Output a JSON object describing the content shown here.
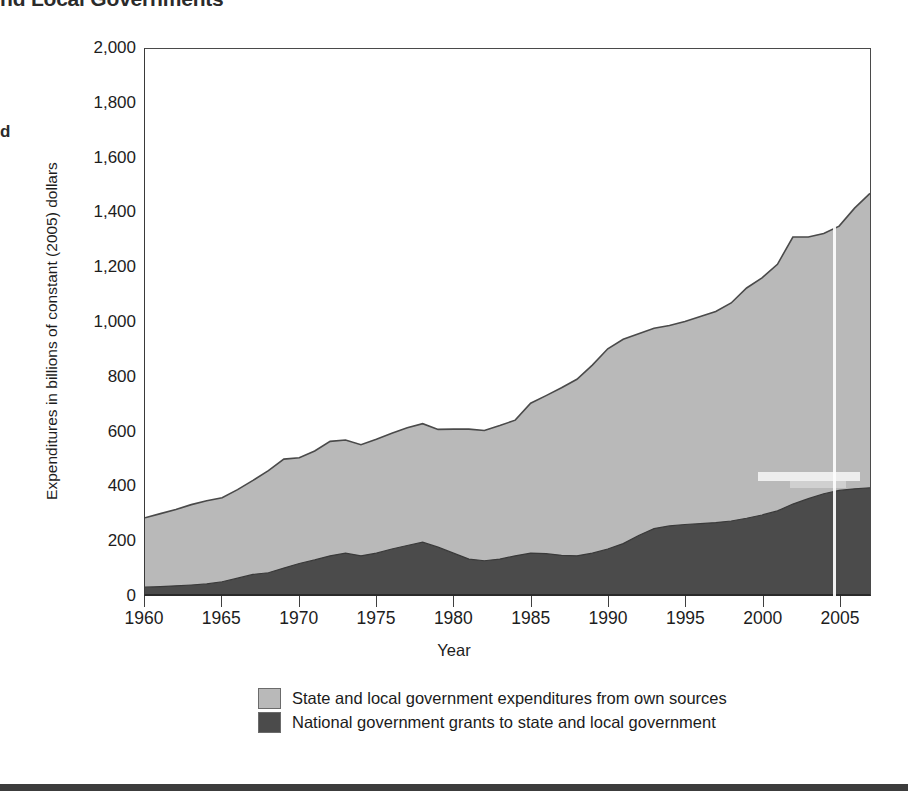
{
  "figure": {
    "title_partial": "nd Local Governments",
    "margin_stub": "d",
    "xaxis_title": "Year",
    "yaxis_title": "Expenditures in billions of constant (2005) dollars"
  },
  "legend": {
    "items": [
      {
        "label": "State and local government expenditures from own sources",
        "color": "#b9b9b9"
      },
      {
        "label": "National government grants to state and local government",
        "color": "#4b4b4b"
      }
    ]
  },
  "axes": {
    "y_ticks": [
      "0",
      "200",
      "400",
      "600",
      "800",
      "1,000",
      "1,200",
      "1,400",
      "1,600",
      "1,800",
      "2,000"
    ],
    "x_ticks": [
      "1960",
      "1965",
      "1970",
      "1975",
      "1980",
      "1985",
      "1990",
      "1995",
      "2000",
      "2005"
    ]
  },
  "colors": {
    "own_sources": "#b9b9b9",
    "grants": "#4b4b4b",
    "outline": "#4a4a4a",
    "axis": "#3a3a3a",
    "bottom_rule": "#3c3c3c"
  },
  "chart_data": {
    "type": "area",
    "stacked": true,
    "title": "nd Local Governments",
    "xlabel": "Year",
    "ylabel": "Expenditures in billions of constant (2005) dollars",
    "xlim": [
      1960,
      2007
    ],
    "ylim": [
      0,
      2000
    ],
    "grid": false,
    "legend_position": "bottom-center",
    "x": [
      1960,
      1961,
      1962,
      1963,
      1964,
      1965,
      1966,
      1967,
      1968,
      1969,
      1970,
      1971,
      1972,
      1973,
      1974,
      1975,
      1976,
      1977,
      1978,
      1979,
      1980,
      1981,
      1982,
      1983,
      1984,
      1985,
      1986,
      1987,
      1988,
      1989,
      1990,
      1991,
      1992,
      1993,
      1994,
      1995,
      1996,
      1997,
      1998,
      1999,
      2000,
      2001,
      2002,
      2003,
      2004,
      2005,
      2006,
      2007
    ],
    "series": [
      {
        "name": "National government grants to state and local government",
        "values": [
          25,
          27,
          30,
          33,
          37,
          45,
          58,
          72,
          78,
          95,
          112,
          125,
          140,
          150,
          140,
          150,
          165,
          178,
          190,
          172,
          150,
          128,
          122,
          128,
          140,
          150,
          148,
          142,
          140,
          150,
          165,
          185,
          215,
          240,
          250,
          255,
          258,
          262,
          268,
          278,
          290,
          305,
          330,
          350,
          368,
          380,
          386,
          390
        ]
      },
      {
        "name": "State and local government expenditures from own sources",
        "values": [
          255,
          268,
          280,
          295,
          305,
          308,
          325,
          345,
          375,
          400,
          388,
          400,
          420,
          415,
          408,
          418,
          425,
          432,
          435,
          432,
          455,
          477,
          478,
          490,
          498,
          550,
          580,
          615,
          648,
          690,
          735,
          750,
          740,
          735,
          735,
          745,
          760,
          775,
          800,
          845,
          870,
          905,
          980,
          960,
          955,
          970,
          1030,
          1080
        ]
      }
    ],
    "totals": [
      280,
      295,
      310,
      328,
      342,
      353,
      383,
      417,
      453,
      495,
      500,
      525,
      560,
      565,
      548,
      568,
      590,
      610,
      625,
      604,
      605,
      605,
      600,
      618,
      638,
      700,
      728,
      757,
      788,
      840,
      900,
      935,
      955,
      975,
      985,
      1000,
      1018,
      1037,
      1068,
      1123,
      1160,
      1210,
      1310,
      1310,
      1323,
      1350,
      1416,
      1470
    ]
  }
}
